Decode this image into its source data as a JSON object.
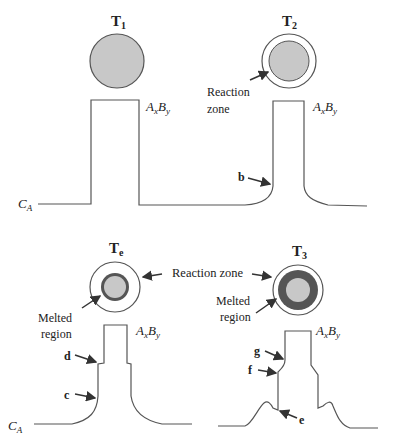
{
  "figure": {
    "panels": [
      {
        "id": "T1",
        "title": "T",
        "subscript": "1",
        "phase_label": "A",
        "phase_sub_x": "x",
        "phase_label_b": "B",
        "phase_sub_y": "y",
        "axis_label": "C",
        "axis_sub": "A"
      },
      {
        "id": "T2",
        "title": "T",
        "subscript": "2",
        "zone_label_line1": "Reaction",
        "zone_label_line2": "zone",
        "phase_label": "A",
        "phase_sub_x": "x",
        "phase_label_b": "B",
        "phase_sub_y": "y",
        "point_label": "b"
      },
      {
        "id": "Te",
        "title": "T",
        "subscript": "e",
        "melt_label_line1": "Melted",
        "melt_label_line2": "region",
        "phase_label": "A",
        "phase_sub_x": "x",
        "phase_label_b": "B",
        "phase_sub_y": "y",
        "point_labels": [
          "d",
          "c"
        ],
        "axis_label": "C",
        "axis_sub": "A"
      },
      {
        "id": "T3",
        "title": "T",
        "subscript": "3",
        "melt_label_line1": "Melted",
        "melt_label_line2": "region",
        "phase_label": "A",
        "phase_sub_x": "x",
        "phase_label_b": "B",
        "phase_sub_y": "y",
        "point_labels": [
          "g",
          "f",
          "e"
        ]
      }
    ],
    "shared_label": "Reaction zone",
    "colors": {
      "particle_fill": "#c8c8c8",
      "melt_ring": "#555555",
      "outline": "#555555",
      "background": "#ffffff"
    }
  }
}
